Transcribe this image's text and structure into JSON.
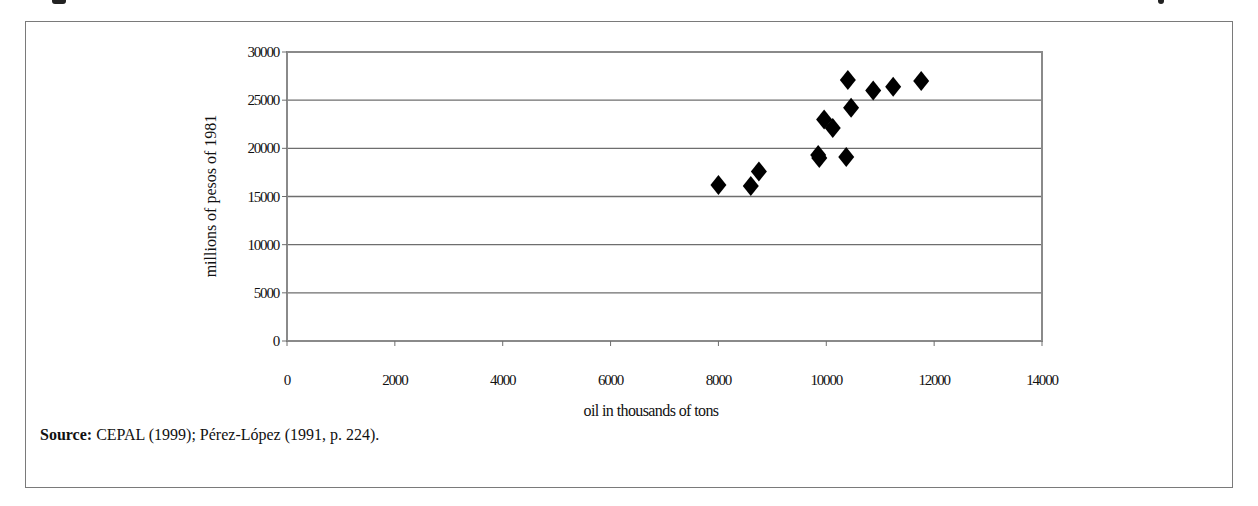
{
  "figure": {
    "source_label": "Source:",
    "source_text": " CEPAL (1999); Pérez-López (1991, p. 224)."
  },
  "chart_data": {
    "type": "scatter",
    "title": "",
    "xlabel": "oil in thousands of tons",
    "ylabel": "millions of  pesos of 1981",
    "xlim": [
      0,
      14000
    ],
    "ylim": [
      0,
      30000
    ],
    "xticks": [
      0,
      2000,
      4000,
      6000,
      8000,
      10000,
      12000,
      14000
    ],
    "yticks": [
      0,
      5000,
      10000,
      15000,
      20000,
      25000,
      30000
    ],
    "grid": {
      "horizontal": true,
      "vertical": false
    },
    "legend": null,
    "marker": "diamond",
    "marker_color": "#000000",
    "series": [
      {
        "name": "observations",
        "points": [
          {
            "x": 8000,
            "y": 16200
          },
          {
            "x": 8600,
            "y": 16100
          },
          {
            "x": 8750,
            "y": 17600
          },
          {
            "x": 9850,
            "y": 19300
          },
          {
            "x": 9870,
            "y": 19000
          },
          {
            "x": 10370,
            "y": 19100
          },
          {
            "x": 9960,
            "y": 23000
          },
          {
            "x": 10120,
            "y": 22100
          },
          {
            "x": 10460,
            "y": 24200
          },
          {
            "x": 10400,
            "y": 27100
          },
          {
            "x": 10870,
            "y": 26000
          },
          {
            "x": 11240,
            "y": 26400
          },
          {
            "x": 11760,
            "y": 27000
          }
        ]
      }
    ]
  }
}
